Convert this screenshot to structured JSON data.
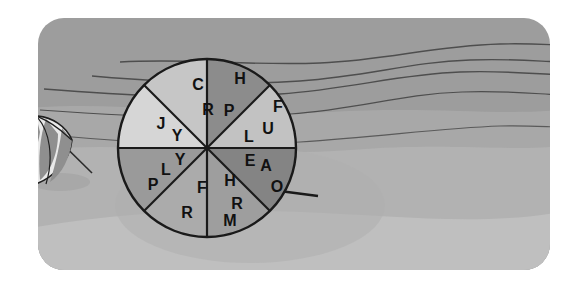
{
  "scene": {
    "title": "Beach scene with segmented prize wheel",
    "width": 585,
    "height": 285,
    "background_color": "#ffffff",
    "sky_color": "#9a9a9a",
    "midground_color": "#a6a6a6",
    "sand_color": "#b4b4b4",
    "foreground_color": "#bdbdbd",
    "line_color": "#4a4a4a",
    "outline_color": "#1a1a1a"
  },
  "umbrella": {
    "name": "beach-umbrella",
    "stripe_light_color": "#e8e8e8",
    "stripe_dark_color": "#8e8e8e",
    "pole_color": "#2b2b2b"
  },
  "wheel": {
    "name": "prize-wheel",
    "center_x": 207,
    "center_y": 148,
    "radius": 89,
    "outline_color": "#1a1a1a",
    "spoke_color": "#1a1a1a",
    "pointer_color": "#1a1a1a",
    "sector_count": 8,
    "sectors": [
      {
        "id": "sector-1",
        "label": "C R",
        "letters": [
          "C",
          "R"
        ],
        "fill": "#c6c6c6",
        "start_angle": -90,
        "end_angle": -45
      },
      {
        "id": "sector-2",
        "label": "H P",
        "letters": [
          "H",
          "P"
        ],
        "fill": "#8c8c8c",
        "start_angle": -90,
        "end_angle": -45
      },
      {
        "id": "sector-3",
        "label": "F U L",
        "letters": [
          "F",
          "U",
          "L"
        ],
        "fill": "#c2c2c2",
        "start_angle": -45,
        "end_angle": 0
      },
      {
        "id": "sector-4",
        "label": "E A O",
        "letters": [
          "E",
          "A",
          "O"
        ],
        "fill": "#848484",
        "start_angle": 0,
        "end_angle": 45
      },
      {
        "id": "sector-5",
        "label": "H R M",
        "letters": [
          "H",
          "R",
          "M"
        ],
        "fill": "#9e9e9e",
        "start_angle": 45,
        "end_angle": 90
      },
      {
        "id": "sector-6",
        "label": "F R",
        "letters": [
          "F",
          "R"
        ],
        "fill": "#ababab",
        "start_angle": 90,
        "end_angle": 135
      },
      {
        "id": "sector-7",
        "label": "Y L P",
        "letters": [
          "Y",
          "L",
          "P"
        ],
        "fill": "#9a9a9a",
        "start_angle": 135,
        "end_angle": 180
      },
      {
        "id": "sector-8",
        "label": "J Y",
        "letters": [
          "J",
          "Y"
        ],
        "fill": "#d6d6d6",
        "start_angle": 180,
        "end_angle": 225
      }
    ],
    "letters": [
      {
        "id": "letter-c",
        "char": "C",
        "x": 198,
        "y": 85,
        "size": 15
      },
      {
        "id": "letter-r-top",
        "char": "R",
        "x": 207,
        "y": 110,
        "size": 15
      },
      {
        "id": "letter-h-top",
        "char": "H",
        "x": 239,
        "y": 79,
        "size": 15
      },
      {
        "id": "letter-p-top",
        "char": "P",
        "x": 228,
        "y": 111,
        "size": 15
      },
      {
        "id": "letter-f-right",
        "char": "F",
        "x": 277,
        "y": 107,
        "size": 15
      },
      {
        "id": "letter-u",
        "char": "U",
        "x": 268,
        "y": 129,
        "size": 15
      },
      {
        "id": "letter-l-right",
        "char": "L",
        "x": 248,
        "y": 137,
        "size": 15
      },
      {
        "id": "letter-e",
        "char": "E",
        "x": 249,
        "y": 161,
        "size": 15
      },
      {
        "id": "letter-a",
        "char": "A",
        "x": 265,
        "y": 166,
        "size": 15
      },
      {
        "id": "letter-o",
        "char": "O",
        "x": 276,
        "y": 187,
        "size": 15
      },
      {
        "id": "letter-h-bottom",
        "char": "H",
        "x": 229,
        "y": 181,
        "size": 15
      },
      {
        "id": "letter-r-bottom-right",
        "char": "R",
        "x": 236,
        "y": 204,
        "size": 15
      },
      {
        "id": "letter-m",
        "char": "M",
        "x": 229,
        "y": 221,
        "size": 15
      },
      {
        "id": "letter-f-bottom",
        "char": "F",
        "x": 202,
        "y": 188,
        "size": 15
      },
      {
        "id": "letter-r-bottom-left",
        "char": "R",
        "x": 187,
        "y": 213,
        "size": 15
      },
      {
        "id": "letter-y-left-lower",
        "char": "Y",
        "x": 180,
        "y": 160,
        "size": 15
      },
      {
        "id": "letter-l-left",
        "char": "L",
        "x": 166,
        "y": 170,
        "size": 15
      },
      {
        "id": "letter-p-left",
        "char": "P",
        "x": 153,
        "y": 185,
        "size": 15
      },
      {
        "id": "letter-j",
        "char": "J",
        "x": 161,
        "y": 124,
        "size": 15
      },
      {
        "id": "letter-y-left-upper",
        "char": "Y",
        "x": 177,
        "y": 136,
        "size": 15
      }
    ]
  }
}
